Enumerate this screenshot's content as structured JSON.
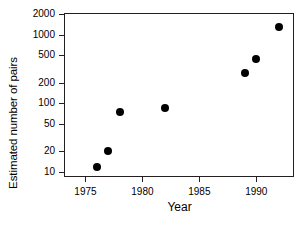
{
  "chart_data": {
    "type": "scatter",
    "title": "",
    "xlabel": "Year",
    "ylabel": "Estimated number of pairs",
    "xlim": [
      1973.2,
      1993.4
    ],
    "ylim": [
      8.2,
      2000
    ],
    "yscale": "log",
    "grid": false,
    "legend": null,
    "xticks": [
      1975,
      1980,
      1985,
      1990
    ],
    "xticklabels": [
      "1975",
      "1980",
      "1985",
      "1990"
    ],
    "yticks": [
      10,
      20,
      50,
      100,
      200,
      500,
      1000,
      2000
    ],
    "yticklabels": [
      "10",
      "20",
      "50",
      "100",
      "200",
      "500",
      "1000",
      "2000"
    ],
    "x": [
      1976,
      1977,
      1978,
      1982,
      1989,
      1990,
      1992
    ],
    "values": [
      12,
      20,
      75,
      85,
      280,
      450,
      1300
    ],
    "points": [
      {
        "x": 1976,
        "y": 12
      },
      {
        "x": 1977,
        "y": 20
      },
      {
        "x": 1978,
        "y": 75
      },
      {
        "x": 1982,
        "y": 85
      },
      {
        "x": 1989,
        "y": 280
      },
      {
        "x": 1990,
        "y": 450
      },
      {
        "x": 1992,
        "y": 1300
      }
    ],
    "marker": "filled-circle",
    "marker_color": "#000000",
    "axis_color": "#231f20"
  }
}
